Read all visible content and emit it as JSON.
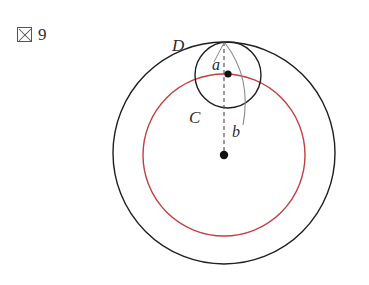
{
  "figure": {
    "caption_glyph": "図",
    "caption_glyph_name": "missing-glyph-box",
    "caption_number": "9",
    "background_color": "#ffffff"
  },
  "colors": {
    "stroke_black": "#1f1f1f",
    "stroke_red": "#c04040",
    "stroke_gray": "#8a8a8a",
    "dot_fill": "#111111",
    "text": "#2b2b2b"
  },
  "labels": {
    "outer_circle": "D",
    "small_circle": "C",
    "upper_point": "a",
    "lower_point": "b"
  },
  "geometry": {
    "outer_circle": {
      "cx": 224,
      "cy": 153,
      "r": 111,
      "stroke": "#1f1f1f",
      "stroke_width": 1.4
    },
    "red_circle": {
      "cx": 224,
      "cy": 155,
      "r": 81,
      "stroke": "#c04040",
      "stroke_width": 1.4
    },
    "small_circle": {
      "cx": 228,
      "cy": 75,
      "r": 33,
      "stroke": "#1f1f1f",
      "stroke_width": 1.4
    },
    "tangent_point": {
      "x": 224,
      "y": 42
    },
    "small_center_dot": {
      "cx": 228,
      "cy": 74,
      "r": 3.6
    },
    "main_center_dot": {
      "cx": 224,
      "cy": 155,
      "r": 4.2
    },
    "dashed_line": {
      "x1": 224,
      "y1": 42,
      "x2": 224,
      "y2": 155
    },
    "gray_arc": {
      "start_x": 225,
      "start_y": 43,
      "end_x": 243,
      "end_y": 125,
      "control_x": 252,
      "control_y": 78
    },
    "label_positions": {
      "D": {
        "x": 172,
        "y": 51
      },
      "a": {
        "x": 212,
        "y": 70
      },
      "C": {
        "x": 189,
        "y": 123
      },
      "b": {
        "x": 232,
        "y": 137
      }
    }
  }
}
